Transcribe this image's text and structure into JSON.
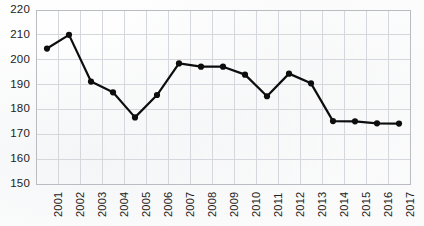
{
  "chart_data": {
    "type": "line",
    "title": "",
    "subtitle": "",
    "xlabel": "",
    "ylabel": "",
    "categories": [
      "2001",
      "2002",
      "2003",
      "2004",
      "2005",
      "2006",
      "2007",
      "2008",
      "2009",
      "2010",
      "2011",
      "2012",
      "2013",
      "2014",
      "2015",
      "2016",
      "2017"
    ],
    "values": [
      204.5,
      210.0,
      191.2,
      186.9,
      176.8,
      185.8,
      198.5,
      197.2,
      197.2,
      194.0,
      185.3,
      194.4,
      190.5,
      175.3,
      175.2,
      174.4,
      174.3
    ],
    "series": [
      {
        "name": "",
        "values": [
          204.5,
          210.0,
          191.2,
          186.9,
          176.8,
          185.8,
          198.5,
          197.2,
          197.2,
          194.0,
          185.3,
          194.4,
          190.5,
          175.3,
          175.2,
          174.4,
          174.3
        ]
      }
    ],
    "ylim": [
      150,
      220
    ],
    "ytick_labels": [
      "150",
      "160",
      "170",
      "180",
      "190",
      "200",
      "210",
      "220"
    ],
    "ytick_values": [
      150,
      160,
      170,
      180,
      190,
      200,
      210,
      220
    ],
    "xtick_labels": [
      "2001",
      "2002",
      "2003",
      "2004",
      "2005",
      "2006",
      "2007",
      "2008",
      "2009",
      "2010",
      "2011",
      "2012",
      "2013",
      "2014",
      "2015",
      "2016",
      "2017"
    ],
    "grid": true,
    "grid_axes": "both",
    "legend": false,
    "legend_position": "none",
    "markers": true,
    "marker_shape": "circle",
    "annotations": [],
    "colors": {
      "line": "#0d0d0d",
      "marker": "#0d0d0d",
      "grid": "#d4d7dc",
      "frame": "#b9bcc2",
      "text": "#222222",
      "background": "#ffffff"
    }
  }
}
